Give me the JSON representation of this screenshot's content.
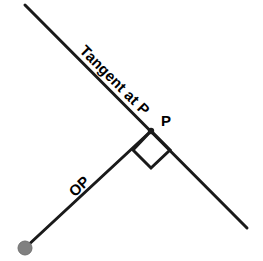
{
  "diagram": {
    "canvas": {
      "width": 263,
      "height": 261,
      "background": "#ffffff"
    },
    "colors": {
      "line": "#1a1a1a",
      "center_point": "#808080",
      "center_point_stroke": "#707070",
      "label_text": "#000000"
    },
    "points": {
      "O": {
        "label": "O",
        "x": 25,
        "y": 248,
        "radius": 7,
        "style": "filled-gray-circle"
      },
      "P": {
        "label": "P",
        "x": 151,
        "y": 131,
        "radius": 3,
        "style": "filled-black-dot"
      }
    },
    "lines": [
      {
        "name": "tangent-line",
        "x1": 25,
        "y1": 5,
        "x2": 247,
        "y2": 228,
        "width": 3,
        "description": "Tangent line passing through P"
      },
      {
        "name": "radius-op",
        "x1": 25,
        "y1": 248,
        "x2": 151,
        "y2": 131,
        "width": 3,
        "description": "Radius segment from center O to point P"
      }
    ],
    "right_angle_marker": {
      "name": "right-angle-square",
      "points": "151,131 133,150 151,168 170,150",
      "width": 3,
      "description": "Square marker indicating 90 degrees between OP and the tangent"
    },
    "labels": {
      "tangent": "Tangent at P",
      "op": "OP",
      "p": "P"
    }
  }
}
